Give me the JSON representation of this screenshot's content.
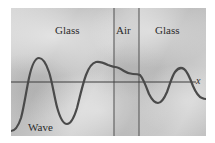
{
  "figure": {
    "panel": {
      "x": 11,
      "y": 8,
      "width": 195,
      "height": 128,
      "fill_color": "#c9c9c9"
    },
    "stroke_color": "#4a4a4a",
    "text_color": "#2b2b2b"
  },
  "labels": {
    "glass_left": "Glass",
    "air": "Air",
    "glass_right": "Glass",
    "wave": "Wave",
    "axis_x": "x"
  },
  "regions": [
    {
      "name": "glass-left",
      "label": "Glass",
      "x_start": 11,
      "x_end": 114
    },
    {
      "name": "air-gap",
      "label": "Air",
      "x_start": 114,
      "x_end": 139
    },
    {
      "name": "glass-right",
      "label": "Glass",
      "x_start": 139,
      "x_end": 206
    }
  ],
  "boundaries": [
    {
      "name": "glass-air-boundary",
      "x": 114
    },
    {
      "name": "air-glass-boundary",
      "x": 139
    }
  ],
  "axis": {
    "name": "x-axis",
    "y": 82,
    "x_start": 11,
    "x_end": 196,
    "label": "x"
  },
  "chart_data": {
    "type": "line",
    "xlabel": "x",
    "ylabel": "",
    "grid": false,
    "legend": null,
    "annotations": [
      "Glass",
      "Air",
      "Glass",
      "Wave",
      "x"
    ],
    "axis_baseline_y": 82,
    "series": [
      {
        "name": "wave",
        "color": "#4a4a4a",
        "path": "M 11,131 C 15,131 18,127 21,118 C 24,107 26,92 29,78 C 32,64 35,58 39,58 C 43,58 46,63 49,72 C 52,81 54,95 57,107 C 60,118 63,124 67,124 C 71,124 74,118 77,108 C 80,96 83,83 86,75 C 89,67 92,63 96,62 C 100,61 104,63 108,65 C 111,66 113,67 115,67 C 118,67 121,69 124,71 C 127,73 130,74 133,74 C 136,74 138,74 140,75 C 143,78 146,86 149,94 C 152,100 155,103 158,103 C 161,103 164,99 167,92 C 170,84 172,76 175,72 C 178,68 181,67 184,69 C 187,71 190,78 193,86 C 196,93 199,97 202,98 C 204,99 205,99 206,99"
      }
    ]
  }
}
